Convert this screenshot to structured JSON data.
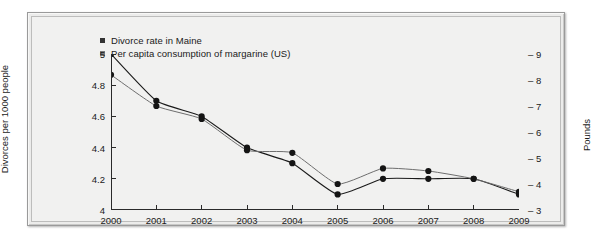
{
  "chart_data": {
    "type": "line",
    "title": "",
    "subtitle": "",
    "xlabel": "",
    "ylabel": "Divorces per 1000 people",
    "y2label": "Pounds",
    "grid": false,
    "legend_position": "top-left",
    "x": [
      2000,
      2001,
      2002,
      2003,
      2004,
      2005,
      2006,
      2007,
      2008,
      2009
    ],
    "xtick_labels": [
      "2000",
      "2001",
      "2002",
      "2003",
      "2004",
      "2005",
      "2006",
      "2007",
      "2008",
      "2009"
    ],
    "xlim": [
      2000,
      2009
    ],
    "ylim": [
      4,
      5
    ],
    "ytick_labels": [
      "4",
      "4.2",
      "4.4",
      "4.6",
      "4.8",
      "5"
    ],
    "ytick_values": [
      4,
      4.2,
      4.4,
      4.6,
      4.8,
      5
    ],
    "y2lim": [
      3,
      9
    ],
    "y2tick_labels": [
      "3",
      "4",
      "5",
      "6",
      "7",
      "8",
      "9"
    ],
    "y2tick_values": [
      3,
      4,
      5,
      6,
      7,
      8,
      9
    ],
    "series": [
      {
        "name": "Divorce rate in Maine",
        "axis": "left",
        "units": "divorces per 1000 people",
        "color": "#1a1a1a",
        "marker": "circle",
        "values": [
          5.0,
          4.7,
          4.6,
          4.4,
          4.3,
          4.1,
          4.2,
          4.2,
          4.2,
          4.1
        ]
      },
      {
        "name": "Per capita consumption of margarine (US)",
        "axis": "right",
        "units": "pounds",
        "color": "#6e6e6e",
        "marker": "circle",
        "values": [
          8.2,
          7.0,
          6.5,
          5.3,
          5.2,
          4.0,
          4.6,
          4.5,
          4.2,
          3.7
        ]
      }
    ]
  },
  "legend": {
    "items": [
      {
        "label": "Divorce rate in Maine",
        "color": "#333333"
      },
      {
        "label": "Per capita consumption of margarine (US)",
        "color": "#7a7a7a"
      }
    ]
  },
  "axes": {
    "left_title": "Divorces per 1000 people",
    "right_title": "Pounds"
  },
  "colors": {
    "frame_border": "#9a9a9a",
    "plot_background": "#f1f1f0",
    "series_1": "#1a1a1a",
    "series_2": "#6e6e6e",
    "axis": "#2a2a2a",
    "text": "#1a1a1a"
  }
}
